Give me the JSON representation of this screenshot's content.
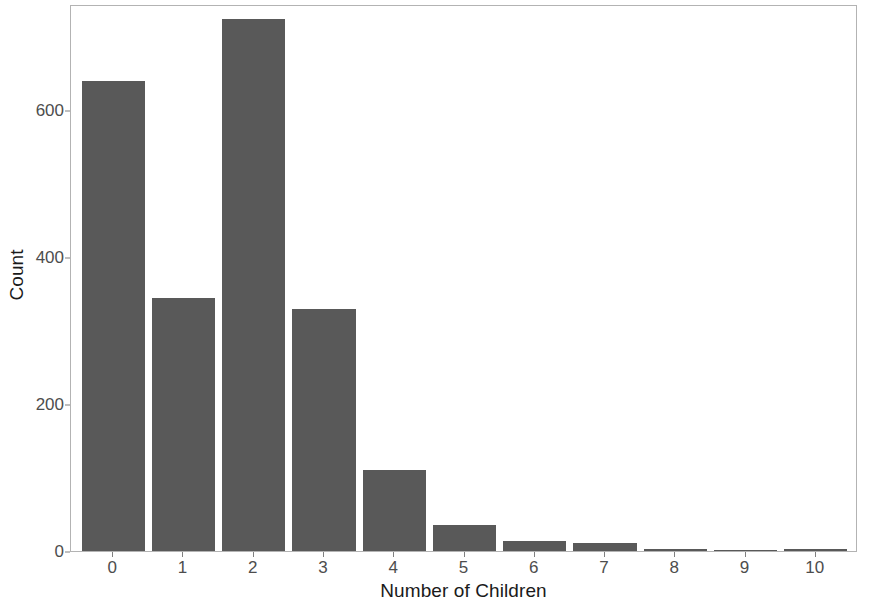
{
  "chart_data": {
    "type": "bar",
    "title": "",
    "subtitle": "",
    "xlabel": "Number of Children",
    "ylabel": "Count",
    "categories": [
      "0",
      "1",
      "2",
      "3",
      "4",
      "5",
      "6",
      "7",
      "8",
      "9",
      "10"
    ],
    "values": [
      640,
      345,
      724,
      330,
      110,
      35,
      13,
      11,
      3,
      1,
      3
    ],
    "series": [
      {
        "name": "Count",
        "values": [
          640,
          345,
          724,
          330,
          110,
          35,
          13,
          11,
          3,
          1,
          3
        ]
      }
    ],
    "ylim": [
      0,
      745
    ],
    "xlim": [
      -0.6,
      10.6
    ],
    "y_ticks": [
      0,
      200,
      400,
      600
    ],
    "y_tick_labels": [
      "0",
      "200",
      "400",
      "600"
    ],
    "x_ticks": [
      0,
      1,
      2,
      3,
      4,
      5,
      6,
      7,
      8,
      9,
      10
    ],
    "x_tick_labels": [
      "0",
      "1",
      "2",
      "3",
      "4",
      "5",
      "6",
      "7",
      "8",
      "9",
      "10"
    ],
    "grid": false,
    "legend": null,
    "legend_position": "none",
    "bar_color": "#595959",
    "panel_border_color": "#b3b3b3",
    "background_color": "#ffffff",
    "axis_text_color": "#4d4d4d",
    "axis_title_color": "#1a1a1a",
    "bar_width_fraction": 0.9,
    "annotations": []
  }
}
